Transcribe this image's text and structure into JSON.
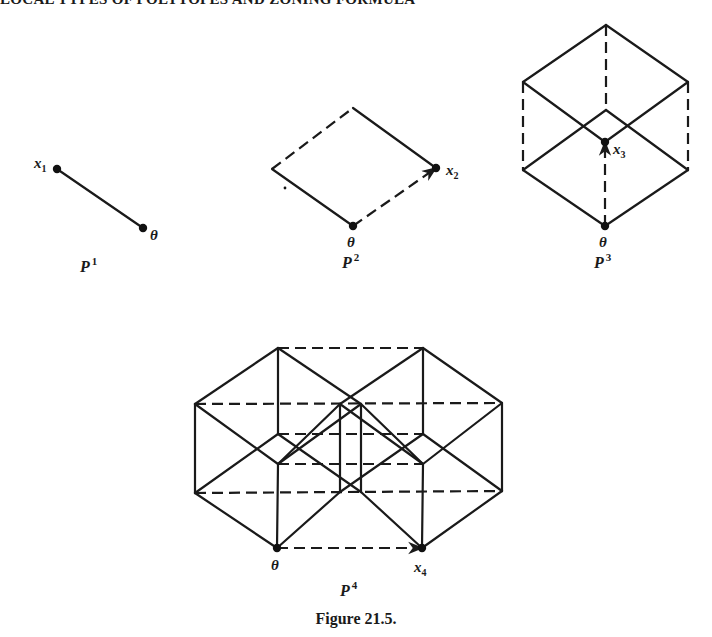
{
  "running_head": "LOCAL TYPES OF POLYTOPES AND ZONING FORMULA",
  "caption": "Figure 21.5.",
  "colors": {
    "ink": "#1a1a1a",
    "background": "#ffffff"
  },
  "figures": [
    {
      "id": "P1",
      "name": {
        "base": "P",
        "sup": "1",
        "x": 80,
        "y": 272
      },
      "edges": [
        {
          "from": [
            57,
            169
          ],
          "to": [
            143,
            228
          ],
          "style": "solid"
        }
      ],
      "vertices": [
        [
          57,
          169
        ],
        [
          143,
          228
        ]
      ],
      "labels": [
        {
          "text": "x",
          "sub": "1",
          "x": 34,
          "y": 168
        },
        {
          "text": "θ",
          "x": 150,
          "y": 240
        }
      ]
    },
    {
      "id": "P2",
      "name": {
        "base": "P",
        "sup": "2",
        "x": 342,
        "y": 268
      },
      "edges": [
        {
          "from": [
            272,
            169
          ],
          "to": [
            353,
            108
          ],
          "style": "dashed"
        },
        {
          "from": [
            353,
            108
          ],
          "to": [
            436,
            168
          ],
          "style": "solid"
        },
        {
          "from": [
            272,
            169
          ],
          "to": [
            353,
            226
          ],
          "style": "solid"
        },
        {
          "from": [
            353,
            226
          ],
          "to": [
            436,
            168
          ],
          "style": "dashed",
          "arrow": true
        }
      ],
      "vertices": [
        [
          353,
          226
        ],
        [
          436,
          168
        ]
      ],
      "extra_dots": [
        [
          285,
          188
        ]
      ],
      "labels": [
        {
          "text": "x",
          "sub": "2",
          "x": 446,
          "y": 175
        },
        {
          "text": "θ",
          "x": 347,
          "y": 247
        }
      ]
    },
    {
      "id": "P3",
      "name": {
        "base": "P",
        "sup": "3",
        "x": 594,
        "y": 268
      },
      "edges": [
        {
          "from": [
            523,
            82
          ],
          "to": [
            606,
            25
          ],
          "style": "solid"
        },
        {
          "from": [
            606,
            25
          ],
          "to": [
            688,
            82
          ],
          "style": "solid"
        },
        {
          "from": [
            606,
            25
          ],
          "to": [
            606,
            110
          ],
          "style": "dashed"
        },
        {
          "from": [
            523,
            82
          ],
          "to": [
            523,
            170
          ],
          "style": "dashed"
        },
        {
          "from": [
            688,
            82
          ],
          "to": [
            688,
            170
          ],
          "style": "dashed"
        },
        {
          "from": [
            523,
            82
          ],
          "to": [
            605,
            142
          ],
          "style": "solid"
        },
        {
          "from": [
            688,
            82
          ],
          "to": [
            605,
            142
          ],
          "style": "solid"
        },
        {
          "from": [
            523,
            170
          ],
          "to": [
            606,
            110
          ],
          "style": "solid"
        },
        {
          "from": [
            688,
            170
          ],
          "to": [
            606,
            110
          ],
          "style": "solid"
        },
        {
          "from": [
            523,
            170
          ],
          "to": [
            605,
            226
          ],
          "style": "solid"
        },
        {
          "from": [
            688,
            170
          ],
          "to": [
            605,
            226
          ],
          "style": "solid"
        },
        {
          "from": [
            605,
            226
          ],
          "to": [
            605,
            142
          ],
          "style": "dashed",
          "arrow": true
        }
      ],
      "vertices": [
        [
          605,
          226
        ],
        [
          605,
          142
        ]
      ],
      "labels": [
        {
          "text": "x",
          "sub": "3",
          "x": 613,
          "y": 154
        },
        {
          "text": "θ",
          "x": 599,
          "y": 247
        }
      ]
    },
    {
      "id": "P4",
      "name": {
        "base": "P",
        "sup": "4",
        "x": 340,
        "y": 596
      },
      "edges": [
        {
          "from": [
            195,
            404
          ],
          "to": [
            278,
            348
          ],
          "style": "solid"
        },
        {
          "from": [
            278,
            348
          ],
          "to": [
            423,
            348
          ],
          "style": "dashed"
        },
        {
          "from": [
            423,
            348
          ],
          "to": [
            502,
            403
          ],
          "style": "solid"
        },
        {
          "from": [
            195,
            404
          ],
          "to": [
            195,
            493
          ],
          "style": "solid"
        },
        {
          "from": [
            502,
            403
          ],
          "to": [
            502,
            491
          ],
          "style": "solid"
        },
        {
          "from": [
            195,
            493
          ],
          "to": [
            277,
            548
          ],
          "style": "solid"
        },
        {
          "from": [
            422,
            548
          ],
          "to": [
            502,
            491
          ],
          "style": "solid"
        },
        {
          "from": [
            277,
            548
          ],
          "to": [
            422,
            548
          ],
          "style": "dashed",
          "arrow": true
        },
        {
          "from": [
            278,
            348
          ],
          "to": [
            278,
            434
          ],
          "style": "solid"
        },
        {
          "from": [
            423,
            348
          ],
          "to": [
            423,
            434
          ],
          "style": "solid"
        },
        {
          "from": [
            278,
            464
          ],
          "to": [
            277,
            548
          ],
          "style": "solid"
        },
        {
          "from": [
            423,
            464
          ],
          "to": [
            422,
            548
          ],
          "style": "solid"
        },
        {
          "from": [
            195,
            404
          ],
          "to": [
            502,
            403
          ],
          "style": "dashed"
        },
        {
          "from": [
            195,
            493
          ],
          "to": [
            502,
            491
          ],
          "style": "dashed"
        },
        {
          "from": [
            278,
            434
          ],
          "to": [
            423,
            434
          ],
          "style": "dashed"
        },
        {
          "from": [
            278,
            464
          ],
          "to": [
            423,
            464
          ],
          "style": "dashed"
        },
        {
          "from": [
            278,
            348
          ],
          "to": [
            361,
            404
          ],
          "style": "solid"
        },
        {
          "from": [
            361,
            404
          ],
          "to": [
            423,
            464
          ],
          "style": "solid"
        },
        {
          "from": [
            423,
            348
          ],
          "to": [
            340,
            404
          ],
          "style": "solid"
        },
        {
          "from": [
            340,
            404
          ],
          "to": [
            278,
            464
          ],
          "style": "solid"
        },
        {
          "from": [
            195,
            404
          ],
          "to": [
            278,
            464
          ],
          "style": "solid"
        },
        {
          "from": [
            195,
            493
          ],
          "to": [
            278,
            434
          ],
          "style": "solid"
        },
        {
          "from": [
            278,
            434
          ],
          "to": [
            361,
            492
          ],
          "style": "solid"
        },
        {
          "from": [
            278,
            464
          ],
          "to": [
            361,
            404
          ],
          "style": "solid"
        },
        {
          "from": [
            340,
            404
          ],
          "to": [
            423,
            464
          ],
          "style": "solid"
        },
        {
          "from": [
            340,
            492
          ],
          "to": [
            423,
            434
          ],
          "style": "solid"
        },
        {
          "from": [
            423,
            434
          ],
          "to": [
            502,
            491
          ],
          "style": "solid"
        },
        {
          "from": [
            423,
            464
          ],
          "to": [
            502,
            403
          ],
          "style": "solid"
        },
        {
          "from": [
            361,
            492
          ],
          "to": [
            422,
            548
          ],
          "style": "solid"
        },
        {
          "from": [
            340,
            492
          ],
          "to": [
            277,
            548
          ],
          "style": "solid"
        },
        {
          "from": [
            340,
            404
          ],
          "to": [
            340,
            492
          ],
          "style": "solid"
        },
        {
          "from": [
            361,
            404
          ],
          "to": [
            361,
            492
          ],
          "style": "solid"
        }
      ],
      "vertices": [
        [
          277,
          548
        ],
        [
          422,
          548
        ]
      ],
      "labels": [
        {
          "text": "θ",
          "x": 271,
          "y": 570
        },
        {
          "text": "x",
          "sub": "4",
          "x": 414,
          "y": 572
        }
      ]
    }
  ]
}
